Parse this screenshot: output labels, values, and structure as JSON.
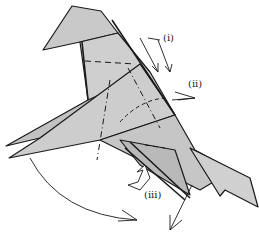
{
  "diagram": {
    "type": "origami-fold-step",
    "labels": [
      {
        "id": "i",
        "text": "(i)",
        "x": 163,
        "y": 33
      },
      {
        "id": "ii",
        "text": "(ii)",
        "x": 188,
        "y": 79
      },
      {
        "id": "iii",
        "text": "(iii)",
        "x": 144,
        "y": 190
      }
    ],
    "colors": {
      "paper": "#c9c9c9",
      "paper_dark": "#a9a9a9",
      "line": "#1a1a1a",
      "background": "#ffffff"
    }
  }
}
